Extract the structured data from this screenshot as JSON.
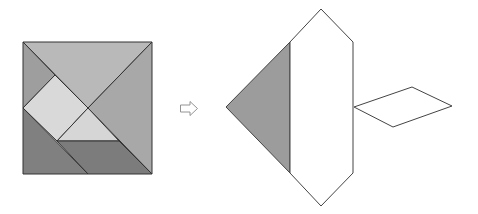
{
  "diagram": {
    "colors": {
      "stroke": "#333333",
      "top_triangle": "#b9b9b9",
      "right_triangle": "#a8a8a8",
      "left_small_triangle": "#9e9e9e",
      "square": "#d9d9d9",
      "small_triangle": "#d6d6d6",
      "parallelogram": "#7c7c7c",
      "bottom_left_triangle": "#808080",
      "figure_triangle": "#9c9c9c",
      "figure_blank": "#ffffff",
      "arrow": "#888888"
    },
    "source_square": {
      "pieces": [
        {
          "name": "top-triangle",
          "points": "23,42 152,42 88,108"
        },
        {
          "name": "right-triangle",
          "points": "152,42 152,174 88,108"
        },
        {
          "name": "left-small-triangle",
          "points": "23,42 55,75 23,108"
        },
        {
          "name": "square-piece",
          "points": "55,75 88,108 57,141 23,108"
        },
        {
          "name": "small-triangle",
          "points": "88,108 119,141 57,141"
        },
        {
          "name": "parallelogram",
          "points": "57,141 119,141 152,174 88,174"
        },
        {
          "name": "bottom-left-triangle",
          "points": "23,108 88,174 23,174"
        }
      ]
    },
    "arrow": {
      "symbol": "⇨"
    },
    "result_figure": {
      "pieces": [
        {
          "name": "figure-triangle",
          "points": "226,107 290,42 290,173"
        },
        {
          "name": "figure-hexagon",
          "points": "290,42 321,9 353,42 353,173 321,206 290,173"
        },
        {
          "name": "figure-rhombus",
          "points": "354,107 412,87 452,106 393,127"
        }
      ]
    }
  }
}
